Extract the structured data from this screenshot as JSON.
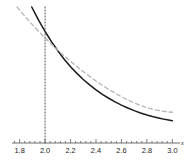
{
  "chart_data": {
    "type": "line",
    "title": "",
    "xlabel": "x",
    "ylabel": "",
    "xlim": [
      1.74,
      3.06
    ],
    "ylim": [
      0.0,
      1.0
    ],
    "grid": false,
    "legend": "none",
    "xticks": [
      "1.8",
      "2.0",
      "2.2",
      "2.4",
      "2.6",
      "2.8",
      "3.0"
    ],
    "xtick_values": [
      1.8,
      2.0,
      2.2,
      2.4,
      2.6,
      2.8,
      3.0
    ],
    "minor_tick_step": 0.04,
    "axis_position_y": 0.0,
    "series": [
      {
        "name": "solid-curve",
        "style": "solid",
        "color": "#1c1c1c",
        "width": 1.5,
        "x": [
          1.895,
          1.92,
          1.95,
          1.98,
          2.0,
          2.05,
          2.1,
          2.15,
          2.2,
          2.25,
          2.3,
          2.35,
          2.4,
          2.45,
          2.5,
          2.55,
          2.6,
          2.65,
          2.7,
          2.75,
          2.8,
          2.85,
          2.9,
          2.95,
          3.0
        ],
        "y": [
          1.0,
          0.955,
          0.902,
          0.852,
          0.82,
          0.745,
          0.678,
          0.616,
          0.561,
          0.512,
          0.467,
          0.427,
          0.391,
          0.358,
          0.329,
          0.302,
          0.278,
          0.257,
          0.238,
          0.221,
          0.206,
          0.193,
          0.182,
          0.172,
          0.164
        ]
      },
      {
        "name": "dashed-curve",
        "style": "dashed",
        "color": "#b4b4b4",
        "width": 1.3,
        "dash": "4,3",
        "x": [
          1.78,
          1.82,
          1.86,
          1.9,
          1.95,
          2.0,
          2.05,
          2.1,
          2.15,
          2.2,
          2.25,
          2.3,
          2.35,
          2.4,
          2.45,
          2.5,
          2.55,
          2.6,
          2.65,
          2.7,
          2.75,
          2.8,
          2.85,
          2.9,
          2.95,
          3.0
        ],
        "y": [
          1.0,
          0.955,
          0.912,
          0.87,
          0.82,
          0.772,
          0.726,
          0.682,
          0.64,
          0.6,
          0.562,
          0.525,
          0.49,
          0.456,
          0.424,
          0.394,
          0.366,
          0.34,
          0.316,
          0.295,
          0.276,
          0.26,
          0.247,
          0.237,
          0.23,
          0.226
        ]
      },
      {
        "name": "vertical-dotted-line",
        "style": "dotted",
        "color": "#4d4d4d",
        "width": 1.0,
        "dash": "1,2",
        "x": [
          2.0,
          2.0
        ],
        "y": [
          0.0,
          1.0
        ]
      }
    ],
    "annotations": []
  },
  "axis": {
    "x_axis_label": "x",
    "tick_color": "#4a4a4a",
    "axis_color": "#4a4a4a"
  }
}
